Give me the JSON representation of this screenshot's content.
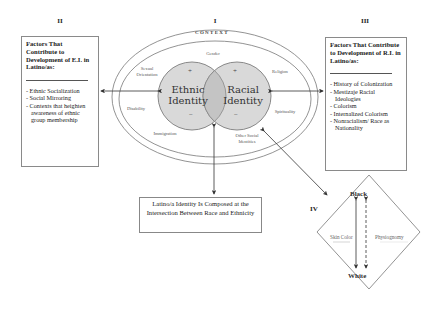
{
  "sections": {
    "i": "I",
    "ii": "II",
    "iii": "III",
    "iv": "IV"
  },
  "context": {
    "title": "CONTEXT",
    "labels": {
      "gender": "Gender",
      "sexual_orientation": "Sexual Orientation",
      "religion": "Religion",
      "disability": "Disability",
      "spirituality": "Spirituality",
      "immigration": "Immigration",
      "other_social_identities": "Other Social Identities"
    }
  },
  "circles": {
    "ethnic": {
      "line1": "Ethnic",
      "line2": "Identity",
      "plus": "+",
      "minus": "−"
    },
    "racial": {
      "line1": "Racial",
      "line2": "Identity",
      "plus": "+",
      "minus": "−"
    }
  },
  "left_box": {
    "title": "Factors That Contribute to Development of E.I. in Latino/as:",
    "items": [
      "- Ethnic Socialization",
      "- Social Mirroring",
      "- Contexts that heighten awareness of ethnic group membership"
    ]
  },
  "right_box": {
    "title": "Factors That Contribute to Development of R.I. in Latino/as:",
    "items": [
      "- History of Colonization",
      "- Mestizaje Racial Ideologies",
      "- Colorism",
      "- Internalized Colorism",
      "- Nonracialism/ Race as Nationality"
    ]
  },
  "center_box": {
    "text": "Latino/a Identity Is Composed at the Intersection Between Race and Ethnicity"
  },
  "diamond": {
    "top": "Black",
    "bottom": "White",
    "left": "Skin Color",
    "right": "Physiognomy"
  },
  "colors": {
    "circle_fill": "#d9d9d9",
    "intersection_fill": "#c4c4c4",
    "line": "#555555"
  }
}
